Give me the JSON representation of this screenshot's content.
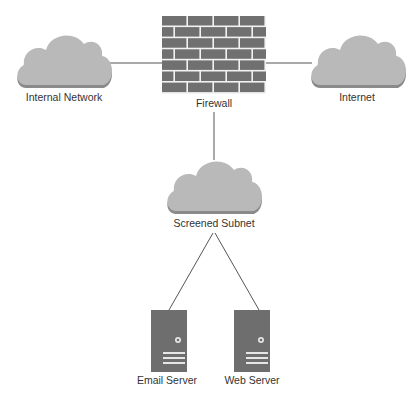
{
  "diagram": {
    "colors": {
      "background": "#ffffff",
      "cloud": "#b9b9b9",
      "cloud_shadow": "#8a8a8a",
      "brick": "#707070",
      "mortar": "#f2f2f2",
      "server": "#6e6e6e",
      "server_detail": "#e6e6e6",
      "line": "#555555",
      "label": "#333333"
    },
    "nodes": {
      "internal_network": {
        "label": "Internal Network",
        "icon": "cloud-icon"
      },
      "firewall": {
        "label": "Firewall",
        "icon": "brick-wall-icon"
      },
      "internet": {
        "label": "Internet",
        "icon": "cloud-icon"
      },
      "screened_subnet": {
        "label": "Screened Subnet",
        "icon": "cloud-icon"
      },
      "email_server": {
        "label": "Email Server",
        "icon": "server-tower-icon"
      },
      "web_server": {
        "label": "Web Server",
        "icon": "server-tower-icon"
      }
    },
    "edges": [
      {
        "from": "Internal Network",
        "to": "Firewall"
      },
      {
        "from": "Firewall",
        "to": "Internet"
      },
      {
        "from": "Firewall",
        "to": "Screened Subnet"
      },
      {
        "from": "Screened Subnet",
        "to": "Email Server"
      },
      {
        "from": "Screened Subnet",
        "to": "Web Server"
      }
    ]
  }
}
